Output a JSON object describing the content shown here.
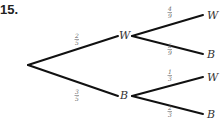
{
  "problem_number": "15.",
  "tree": {
    "root": {
      "x": 28,
      "y": 65
    },
    "level1": [
      {
        "label": "W",
        "prob_num": "2",
        "prob_den": "5",
        "node": {
          "x": 132,
          "y": 36
        },
        "label_pos": {
          "x": 119,
          "y": 39
        },
        "prob_pos": {
          "x": 75,
          "y": 38
        },
        "children": [
          {
            "label": "W",
            "prob_num": "4",
            "prob_den": "9",
            "end": {
              "x": 203,
              "y": 15
            },
            "label_pos": {
              "x": 207,
              "y": 19
            },
            "prob_pos": {
              "x": 168,
              "y": 11
            }
          },
          {
            "label": "B",
            "prob_num": "5",
            "prob_den": "9",
            "end": {
              "x": 203,
              "y": 54
            },
            "label_pos": {
              "x": 207,
              "y": 58
            },
            "prob_pos": {
              "x": 168,
              "y": 48
            }
          }
        ]
      },
      {
        "label": "B",
        "prob_num": "3",
        "prob_den": "5",
        "node": {
          "x": 132,
          "y": 96
        },
        "label_pos": {
          "x": 120,
          "y": 99
        },
        "prob_pos": {
          "x": 75,
          "y": 94
        },
        "children": [
          {
            "label": "W",
            "prob_num": "1",
            "prob_den": "3",
            "end": {
              "x": 203,
              "y": 77
            },
            "label_pos": {
              "x": 207,
              "y": 81
            },
            "prob_pos": {
              "x": 168,
              "y": 74
            }
          },
          {
            "label": "B",
            "prob_num": "2",
            "prob_den": "3",
            "end": {
              "x": 203,
              "y": 114
            },
            "label_pos": {
              "x": 207,
              "y": 118
            },
            "prob_pos": {
              "x": 168,
              "y": 110
            }
          }
        ]
      }
    ]
  },
  "colors": {
    "line": "#111111",
    "text": "#333333",
    "fraction": "#666666"
  }
}
